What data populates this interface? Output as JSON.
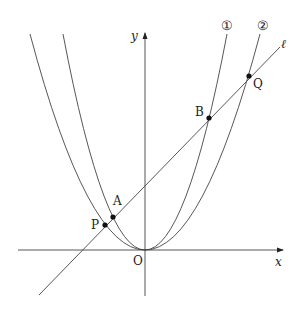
{
  "diagram": {
    "type": "coordinate-plane",
    "axes": {
      "x_label": "x",
      "y_label": "y",
      "origin_label": "O"
    },
    "curves": [
      {
        "id": "parabola-1",
        "label": "①",
        "description": "steeper parabola through O, A, B"
      },
      {
        "id": "parabola-2",
        "label": "②",
        "description": "wider parabola through O, P, Q"
      }
    ],
    "line": {
      "label": "ℓ",
      "description": "line intersecting parabolas at P, A, B, Q"
    },
    "points": [
      {
        "name": "P",
        "on": [
          "line",
          "parabola-2"
        ]
      },
      {
        "name": "A",
        "on": [
          "line",
          "parabola-1"
        ]
      },
      {
        "name": "B",
        "on": [
          "line",
          "parabola-1"
        ]
      },
      {
        "name": "Q",
        "on": [
          "line",
          "parabola-2"
        ]
      }
    ]
  },
  "labels": {
    "x": "x",
    "y": "y",
    "O": "O",
    "P": "P",
    "A": "A",
    "B": "B",
    "Q": "Q",
    "l": "ℓ",
    "c1": "①",
    "c2": "②"
  }
}
